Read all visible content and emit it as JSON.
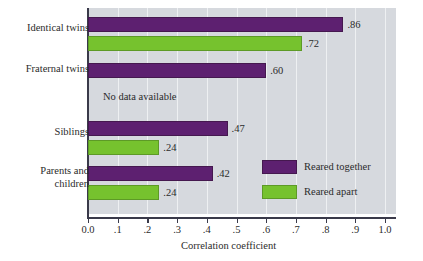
{
  "chart_data": {
    "type": "bar",
    "orientation": "horizontal",
    "title": "",
    "xlabel": "Correlation coefficient",
    "ylabel": "",
    "xlim": [
      0.0,
      1.0
    ],
    "grid": true,
    "legend_position": "inside-lower-right",
    "categories": [
      "Identical twins",
      "Fraternal twins",
      "Siblings",
      "Parents and\nchildren"
    ],
    "tick_labels": [
      "0.0",
      ".1",
      ".2",
      ".3",
      ".4",
      ".5",
      ".6",
      ".7",
      ".8",
      ".9",
      "1.0"
    ],
    "tick_values": [
      0.0,
      0.1,
      0.2,
      0.3,
      0.4,
      0.5,
      0.6,
      0.7,
      0.8,
      0.9,
      1.0
    ],
    "series": [
      {
        "name": "Reared together",
        "color": "#5d2070",
        "values": [
          0.86,
          0.6,
          0.47,
          0.42
        ],
        "labels": [
          ".86",
          ".60",
          ".47",
          ".42"
        ]
      },
      {
        "name": "Reared apart",
        "color": "#76c22e",
        "values": [
          0.72,
          null,
          0.24,
          0.24
        ],
        "labels": [
          ".72",
          null,
          ".24",
          ".24"
        ]
      }
    ],
    "annotations": [
      {
        "text": "No data available",
        "category": "Fraternal twins",
        "series": "Reared apart"
      }
    ]
  },
  "legend": {
    "items": [
      {
        "label": "Reared together",
        "color": "#5d2070"
      },
      {
        "label": "Reared apart",
        "color": "#76c22e"
      }
    ]
  },
  "colors": {
    "plot_background": "#d6d9de",
    "axis": "#3a3a4a",
    "gridline": "#eef0f2",
    "text": "#2b2b2b",
    "reared_together": "#5d2070",
    "reared_apart": "#76c22e"
  }
}
